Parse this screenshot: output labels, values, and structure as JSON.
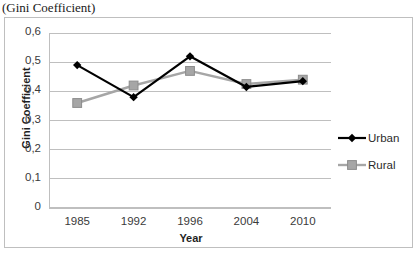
{
  "caption": "(Gini Coefficient)",
  "chart_data": {
    "type": "line",
    "title": "",
    "categories": [
      "1985",
      "1992",
      "1996",
      "2004",
      "2010"
    ],
    "series": [
      {
        "name": "Urban",
        "values": [
          0.49,
          0.38,
          0.52,
          0.415,
          0.435
        ],
        "color": "#000000",
        "marker": "diamond"
      },
      {
        "name": "Rural",
        "values": [
          0.36,
          0.42,
          0.47,
          0.425,
          0.44
        ],
        "color": "#A6A6A6",
        "marker": "square"
      }
    ],
    "xlabel": "Year",
    "ylabel": "Gini Coefficient",
    "ylim": [
      0,
      0.6
    ],
    "yticks": [
      "0",
      "0,1",
      "0,2",
      "0,3",
      "0,4",
      "0,5",
      "0,6"
    ],
    "ytick_values": [
      0,
      0.1,
      0.2,
      0.3,
      0.4,
      0.5,
      0.6
    ],
    "grid": true,
    "legend_position": "right",
    "legend": [
      "Urban",
      "Rural"
    ]
  },
  "colors": {
    "urban": "#000000",
    "rural": "#A6A6A6",
    "grid": "#BFBFBF",
    "frame": "#BFBFBF",
    "text": "#3A3A3A"
  }
}
